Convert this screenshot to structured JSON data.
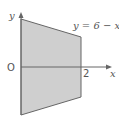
{
  "diagram": {
    "y_axis_label": "y",
    "x_axis_label": "x",
    "origin_label": "O",
    "x_tick_label": "2",
    "curve_label": "y = 6 − x",
    "colors": {
      "fill": "#cfcfcf",
      "stroke": "#666666",
      "axis": "#666666"
    }
  }
}
